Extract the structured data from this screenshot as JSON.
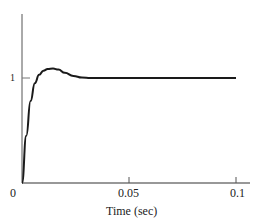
{
  "chart_data": {
    "type": "line",
    "title": "",
    "xlabel": "Time (sec)",
    "ylabel": "",
    "xlim": [
      0,
      0.105
    ],
    "ylim": [
      0,
      1.5
    ],
    "grid": false,
    "legend": null,
    "x_ticks": [
      0,
      0.05,
      0.1
    ],
    "x_tick_labels": [
      "0",
      "0.05",
      "0.1"
    ],
    "y_ticks": [
      1
    ],
    "y_tick_labels": [
      "1"
    ],
    "series": [
      {
        "name": "step response",
        "x": [
          0,
          0.002,
          0.004,
          0.006,
          0.008,
          0.01,
          0.012,
          0.0145,
          0.017,
          0.02,
          0.024,
          0.028,
          0.032,
          0.04,
          0.06,
          0.08,
          0.1
        ],
        "y": [
          0,
          0.45,
          0.78,
          0.95,
          1.03,
          1.07,
          1.085,
          1.09,
          1.08,
          1.05,
          1.02,
          1.005,
          1.0,
          1.0,
          1.0,
          1.0,
          1.0
        ]
      }
    ],
    "annotations": []
  },
  "labels": {
    "origin": "0",
    "x_tick_mid": "0.05",
    "x_tick_end": "0.1",
    "y_tick_one": "1",
    "xlabel": "Time (sec)"
  }
}
